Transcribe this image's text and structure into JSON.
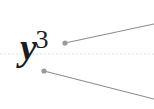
{
  "figure": {
    "name": "annotated-math-expression",
    "width": 154,
    "height": 109,
    "background_color": "#ffffff"
  },
  "expression": {
    "full_text": "y3",
    "base": "y",
    "exponent": "3",
    "spoken": "y cubed",
    "color": "#1c1c1c"
  },
  "guides": {
    "baseline": {
      "label": "baseline",
      "style": "dotted",
      "color": "#e2e2e2",
      "y": 54,
      "x1": 0,
      "x2": 154
    }
  },
  "leaders": [
    {
      "label": "leader-upper",
      "color": "#8c8c8c",
      "dot_color": "#9a9a9a",
      "dot_radius": 2.6,
      "x1": 65,
      "y1": 43,
      "x2": 154,
      "y2": 24,
      "stroke_width": 1.1
    },
    {
      "label": "leader-lower",
      "color": "#8c8c8c",
      "dot_color": "#9a9a9a",
      "dot_radius": 2.6,
      "x1": 44,
      "y1": 71,
      "x2": 154,
      "y2": 99,
      "stroke_width": 1.1
    }
  ]
}
